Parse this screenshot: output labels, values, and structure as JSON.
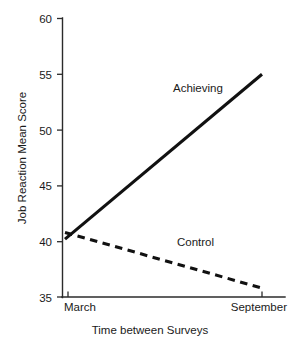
{
  "chart_data": {
    "type": "line",
    "title": "",
    "xlabel": "Time between Surveys",
    "ylabel": "Job Reaction Mean Score",
    "categories": [
      "March",
      "September"
    ],
    "x_tick_labels": [
      "March",
      "September"
    ],
    "y_tick_labels": [
      "35",
      "40",
      "45",
      "50",
      "55",
      "60"
    ],
    "y_ticks": [
      35,
      40,
      45,
      50,
      55,
      60
    ],
    "ylim": [
      35,
      60
    ],
    "xlim": [
      0,
      1
    ],
    "grid": false,
    "legend_position": "inline-annotation",
    "series": [
      {
        "name": "Achieving",
        "style": "solid",
        "x": [
          0,
          1
        ],
        "values": [
          40.2,
          55.0
        ]
      },
      {
        "name": "Control",
        "style": "dashed",
        "x": [
          0,
          1
        ],
        "values": [
          40.8,
          35.8
        ]
      }
    ],
    "annotations": [
      {
        "text": "Achieving",
        "x": 0.52,
        "y": 52.3
      },
      {
        "text": "Control",
        "x": 0.55,
        "y": 38.6
      }
    ],
    "colors": {
      "axis": "#2b2b2b",
      "series_line": "#111111",
      "text": "#1a1a1a",
      "background": "#ffffff"
    }
  },
  "axes": {
    "y_title": "Job Reaction Mean Score",
    "x_title": "Time between Surveys",
    "y_tick_60": "60",
    "y_tick_55": "55",
    "y_tick_50": "50",
    "y_tick_45": "45",
    "y_tick_40": "40",
    "y_tick_35": "35",
    "x_tick_left": "March",
    "x_tick_right": "September"
  },
  "labels": {
    "series_achieving": "Achieving",
    "series_control": "Control"
  }
}
